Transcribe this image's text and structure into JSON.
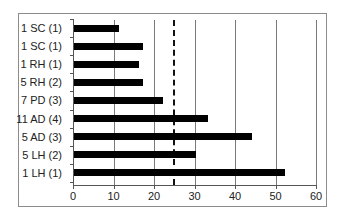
{
  "chart_data": {
    "type": "bar",
    "orientation": "horizontal",
    "title": "",
    "xlabel": "",
    "ylabel": "",
    "categories": [
      "1 SC (1)",
      "1 SC (1)",
      "1 RH (1)",
      "5 RH (2)",
      "7 PD (3)",
      "11 AD (4)",
      "5 AD (3)",
      "5 LH (2)",
      "1 LH (1)"
    ],
    "values": [
      11,
      17,
      16,
      17,
      22,
      33,
      44,
      30,
      52
    ],
    "xlim": [
      0,
      60
    ],
    "xticks": [
      "0",
      "10",
      "20",
      "30",
      "40",
      "50",
      "60"
    ],
    "grid": "vertical at 10,20,30,40,50,60",
    "reference_line": {
      "x": 25,
      "style": "dashed"
    },
    "bar_color": "#000000",
    "legend": null
  }
}
